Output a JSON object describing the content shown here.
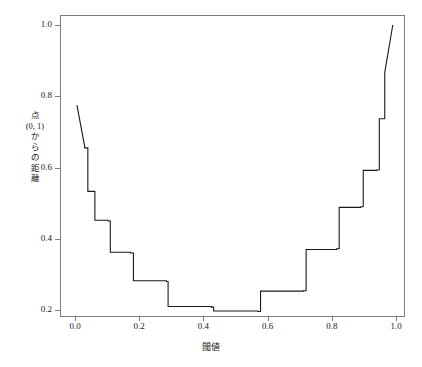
{
  "chart_data": {
    "type": "line",
    "title": "",
    "subtitle": "",
    "xlabel": "閾値",
    "ylabel": "点 (0, 1) からの距離",
    "ylabel_lines": [
      "点",
      "(0, 1)",
      "か",
      "ら",
      "の",
      "距",
      "離"
    ],
    "xlim": [
      -0.03,
      1.03
    ],
    "ylim": [
      0.17,
      1.02
    ],
    "xticks": [
      0.0,
      0.2,
      0.4,
      0.6,
      0.8,
      1.0
    ],
    "xtick_labels": [
      "0.0",
      "0.2",
      "0.4",
      "0.6",
      "0.8",
      "1.0"
    ],
    "yticks": [
      0.2,
      0.4,
      0.6,
      0.8,
      1.0
    ],
    "ytick_labels": [
      "0.2",
      "0.4",
      "0.6",
      "0.8",
      "1.0"
    ],
    "grid": false,
    "legend": null,
    "line_color": "#1a1a1a",
    "line_width": 1.1,
    "frame_color": "#7d7d7d",
    "step_style": "post",
    "series": [
      {
        "name": "distance-from-(0,1)",
        "x": [
          0.006,
          0.03,
          0.03,
          0.04,
          0.04,
          0.062,
          0.062,
          0.103,
          0.103,
          0.11,
          0.11,
          0.173,
          0.173,
          0.182,
          0.182,
          0.285,
          0.285,
          0.29,
          0.29,
          0.425,
          0.425,
          0.432,
          0.432,
          0.57,
          0.57,
          0.578,
          0.578,
          0.712,
          0.712,
          0.72,
          0.72,
          0.815,
          0.815,
          0.823,
          0.823,
          0.89,
          0.89,
          0.898,
          0.898,
          0.94,
          0.94,
          0.948,
          0.948,
          0.965,
          0.965,
          0.99
        ],
        "y": [
          0.775,
          0.66,
          0.655,
          0.655,
          0.533,
          0.533,
          0.452,
          0.452,
          0.45,
          0.45,
          0.362,
          0.362,
          0.36,
          0.36,
          0.282,
          0.282,
          0.28,
          0.28,
          0.21,
          0.21,
          0.208,
          0.208,
          0.197,
          0.197,
          0.196,
          0.196,
          0.253,
          0.253,
          0.254,
          0.254,
          0.37,
          0.37,
          0.372,
          0.372,
          0.488,
          0.488,
          0.49,
          0.49,
          0.592,
          0.592,
          0.593,
          0.593,
          0.737,
          0.737,
          0.867,
          1.0
        ]
      }
    ]
  }
}
